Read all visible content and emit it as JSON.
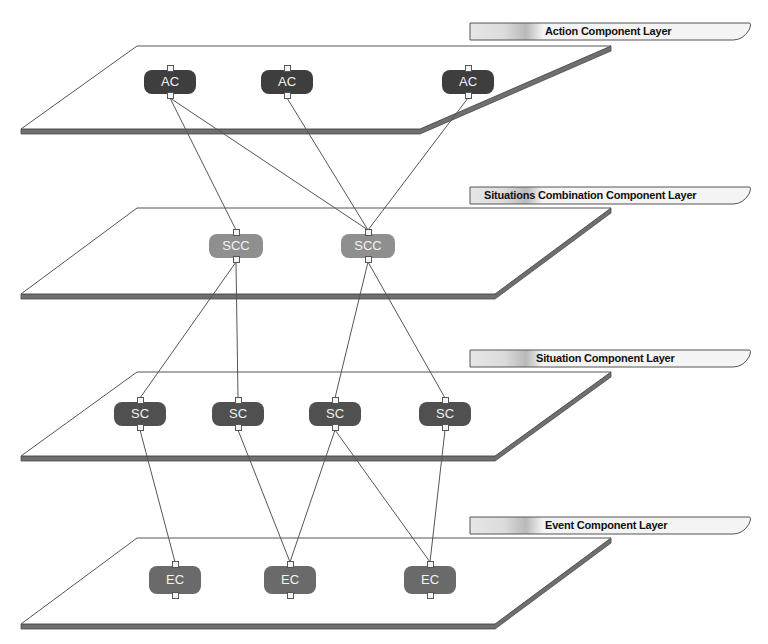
{
  "diagram": {
    "colors": {
      "plane_fill": "#ffffff",
      "plane_stroke": "#555555",
      "plane_edge": "#6f6f6f",
      "edge_line": "#555555",
      "ac_node": "#3e3e3e",
      "scc_node": "#8f8f8f",
      "sc_node": "#505050",
      "ec_node": "#6a6a6a",
      "tab_fill": "#f2f2f2",
      "tab_accent": "#c8c8c8"
    },
    "layers": [
      {
        "id": "action",
        "label": "Action Component Layer",
        "plane": {
          "top_y": 46,
          "bottom_y": 129,
          "top_left_x": 137,
          "top_right_x": 611,
          "bottom_left_x": 21,
          "bottom_right_x": 420
        },
        "tab": {
          "x": 469,
          "y": 22,
          "w": 280,
          "text_x": 545
        },
        "nodes": [
          {
            "id": "ac1",
            "label": "AC",
            "cx": 170,
            "cy": 82
          },
          {
            "id": "ac2",
            "label": "AC",
            "cx": 287,
            "cy": 82
          },
          {
            "id": "ac3",
            "label": "AC",
            "cx": 468,
            "cy": 82
          }
        ]
      },
      {
        "id": "situations-combination",
        "label": "Situations Combination Component Layer",
        "plane": {
          "top_y": 208,
          "bottom_y": 294,
          "top_left_x": 137,
          "top_right_x": 611,
          "bottom_left_x": 21,
          "bottom_right_x": 495
        },
        "tab": {
          "x": 469,
          "y": 186,
          "w": 280,
          "text_x": 484
        },
        "nodes": [
          {
            "id": "scc1",
            "label": "SCC",
            "cx": 236,
            "cy": 246
          },
          {
            "id": "scc2",
            "label": "SCC",
            "cx": 368,
            "cy": 246
          }
        ]
      },
      {
        "id": "situation",
        "label": "Situation Component Layer",
        "plane": {
          "top_y": 372,
          "bottom_y": 456,
          "top_left_x": 137,
          "top_right_x": 611,
          "bottom_left_x": 21,
          "bottom_right_x": 495
        },
        "tab": {
          "x": 469,
          "y": 349,
          "w": 280,
          "text_x": 536
        },
        "nodes": [
          {
            "id": "sc1",
            "label": "SC",
            "cx": 140,
            "cy": 414
          },
          {
            "id": "sc2",
            "label": "SC",
            "cx": 238,
            "cy": 414
          },
          {
            "id": "sc3",
            "label": "SC",
            "cx": 335,
            "cy": 414
          },
          {
            "id": "sc4",
            "label": "SC",
            "cx": 445,
            "cy": 414
          }
        ]
      },
      {
        "id": "event",
        "label": "Event Component Layer",
        "plane": {
          "top_y": 538,
          "bottom_y": 624,
          "top_left_x": 137,
          "top_right_x": 611,
          "bottom_left_x": 21,
          "bottom_right_x": 495
        },
        "tab": {
          "x": 469,
          "y": 516,
          "w": 280,
          "text_x": 545
        },
        "nodes": [
          {
            "id": "ec1",
            "label": "EC",
            "cx": 175,
            "cy": 580
          },
          {
            "id": "ec2",
            "label": "EC",
            "cx": 290,
            "cy": 580
          },
          {
            "id": "ec3",
            "label": "EC",
            "cx": 430,
            "cy": 580
          }
        ]
      }
    ],
    "edges": [
      [
        "ac1",
        "scc1"
      ],
      [
        "ac1",
        "scc2"
      ],
      [
        "ac2",
        "scc2"
      ],
      [
        "ac3",
        "scc2"
      ],
      [
        "scc1",
        "sc1"
      ],
      [
        "scc1",
        "sc2"
      ],
      [
        "scc2",
        "sc3"
      ],
      [
        "scc2",
        "sc4"
      ],
      [
        "sc1",
        "ec1"
      ],
      [
        "sc2",
        "ec2"
      ],
      [
        "sc3",
        "ec2"
      ],
      [
        "sc3",
        "ec3"
      ],
      [
        "sc4",
        "ec3"
      ]
    ]
  }
}
